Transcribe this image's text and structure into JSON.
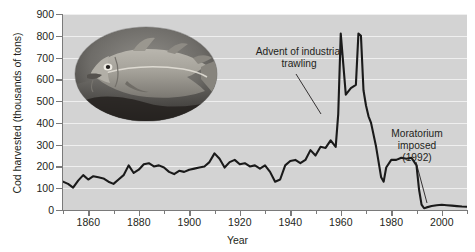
{
  "chart_data": {
    "type": "line",
    "title": "",
    "xlabel": "Year",
    "ylabel": "Cod harvested (thousands of tons)",
    "xlim": [
      1850,
      2010
    ],
    "ylim": [
      0,
      900
    ],
    "ytick_values": [
      0,
      100,
      200,
      300,
      400,
      500,
      600,
      700,
      800,
      900
    ],
    "ytick_labels": [
      "0",
      "100",
      "200",
      "300",
      "400",
      "500",
      "600",
      "700",
      "800",
      "900"
    ],
    "xtick_values": [
      1860,
      1880,
      1900,
      1920,
      1940,
      1960,
      1980,
      2000
    ],
    "xtick_labels": [
      "1860",
      "1880",
      "1900",
      "1920",
      "1940",
      "1960",
      "1980",
      "2000"
    ],
    "xtick_minor_values": [
      1850,
      1870,
      1890,
      1910,
      1930,
      1950,
      1970,
      1990,
      2010
    ],
    "grid": "horizontal",
    "legend": "none",
    "line_color": "#1a1a1a",
    "plot_background": "#d3d3d3",
    "gridline_color": "#efefef",
    "series": [
      {
        "name": "Cod harvested",
        "x": [
          1850,
          1852,
          1854,
          1856,
          1858,
          1860,
          1862,
          1864,
          1866,
          1868,
          1870,
          1872,
          1874,
          1876,
          1878,
          1880,
          1882,
          1884,
          1886,
          1888,
          1890,
          1892,
          1894,
          1896,
          1898,
          1900,
          1902,
          1904,
          1906,
          1908,
          1910,
          1912,
          1914,
          1916,
          1918,
          1920,
          1922,
          1924,
          1926,
          1928,
          1930,
          1932,
          1934,
          1936,
          1938,
          1940,
          1942,
          1944,
          1946,
          1948,
          1950,
          1952,
          1954,
          1956,
          1958,
          1959,
          1960,
          1962,
          1964,
          1966,
          1967,
          1968,
          1969,
          1970,
          1971,
          1972,
          1974,
          1976,
          1977,
          1978,
          1980,
          1982,
          1984,
          1986,
          1988,
          1990,
          1991,
          1992,
          1993,
          1994,
          1996,
          1998,
          2000,
          2002,
          2004,
          2006,
          2008,
          2010
        ],
        "y": [
          130,
          120,
          103,
          135,
          160,
          140,
          155,
          150,
          145,
          130,
          120,
          140,
          160,
          205,
          170,
          185,
          210,
          215,
          200,
          205,
          195,
          175,
          165,
          180,
          175,
          185,
          190,
          195,
          200,
          220,
          260,
          235,
          195,
          220,
          230,
          210,
          215,
          200,
          205,
          190,
          205,
          175,
          130,
          140,
          205,
          225,
          230,
          215,
          230,
          275,
          250,
          290,
          285,
          320,
          290,
          440,
          810,
          530,
          560,
          575,
          810,
          800,
          550,
          480,
          430,
          400,
          290,
          150,
          130,
          195,
          230,
          230,
          240,
          235,
          240,
          205,
          95,
          25,
          8,
          12,
          18,
          22,
          24,
          22,
          20,
          18,
          16,
          15
        ]
      }
    ],
    "annotations": [
      {
        "name": "advent-of-industrial-trawling",
        "text": "Advent of industrial\ntrawling",
        "points_to_year": 1959,
        "points_to_value": 440
      },
      {
        "name": "moratorium-imposed",
        "text": "Moratorium\nimposed\n(1992)",
        "points_to_year": 1993,
        "points_to_value": 8
      }
    ],
    "inset_image": {
      "name": "atlantic-cod-photo",
      "description": "Oval black-and-white photograph of an Atlantic cod fish",
      "shape": "ellipse"
    }
  }
}
